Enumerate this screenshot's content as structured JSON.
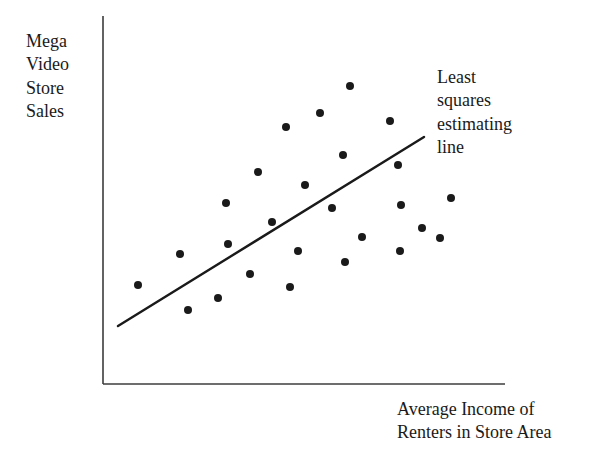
{
  "figure": {
    "background_color": "#ffffff",
    "ink_color": "#1a1a1a",
    "y_axis_title_lines": [
      "Mega",
      "Video",
      "Store",
      "Sales"
    ],
    "x_axis_title_lines": [
      "Average Income of",
      "Renters in Store Area"
    ],
    "annotation_lines": [
      "Least",
      "squares",
      "estimating",
      "line"
    ]
  },
  "chart_data": {
    "type": "scatter",
    "title": "",
    "xlabel": "Average Income of Renters in Store Area",
    "ylabel": "Mega Video Store Sales",
    "grid": false,
    "legend": null,
    "axis_ticks": {
      "x": [],
      "y": []
    },
    "xlim": [
      103,
      505
    ],
    "ylim": [
      384,
      16
    ],
    "annotations": [
      {
        "text": "Least squares estimating line",
        "x": 437,
        "y": 66,
        "points_to": "regression-line"
      }
    ],
    "series": [
      {
        "name": "Store observations",
        "type": "scatter",
        "marker": "filled-circle",
        "marker_color": "#1a1a1a",
        "marker_radius": 4,
        "points": [
          {
            "x": 350,
            "y": 86
          },
          {
            "x": 320,
            "y": 113
          },
          {
            "x": 390,
            "y": 121
          },
          {
            "x": 286,
            "y": 127
          },
          {
            "x": 343,
            "y": 155
          },
          {
            "x": 398,
            "y": 165
          },
          {
            "x": 258,
            "y": 172
          },
          {
            "x": 305,
            "y": 185
          },
          {
            "x": 451,
            "y": 198
          },
          {
            "x": 226,
            "y": 203
          },
          {
            "x": 401,
            "y": 205
          },
          {
            "x": 332,
            "y": 208
          },
          {
            "x": 440,
            "y": 238
          },
          {
            "x": 362,
            "y": 237
          },
          {
            "x": 228,
            "y": 244
          },
          {
            "x": 400,
            "y": 251
          },
          {
            "x": 298,
            "y": 251
          },
          {
            "x": 180,
            "y": 254
          },
          {
            "x": 345,
            "y": 262
          },
          {
            "x": 250,
            "y": 274
          },
          {
            "x": 138,
            "y": 285
          },
          {
            "x": 290,
            "y": 287
          },
          {
            "x": 218,
            "y": 298
          },
          {
            "x": 188,
            "y": 310
          },
          {
            "x": 422,
            "y": 228
          },
          {
            "x": 272,
            "y": 222
          }
        ]
      },
      {
        "name": "Least squares estimating line",
        "type": "line",
        "line_color": "#1a1a1a",
        "line_width": 2.4,
        "x1": 118,
        "y1": 326,
        "x2": 424,
        "y2": 137
      }
    ],
    "axes": {
      "y_axis": {
        "x1": 103,
        "y1": 16,
        "x2": 103,
        "y2": 384
      },
      "x_axis": {
        "x1": 103,
        "y1": 384,
        "x2": 505,
        "y2": 384
      },
      "color": "#3c3c3c",
      "width": 1.6
    }
  }
}
